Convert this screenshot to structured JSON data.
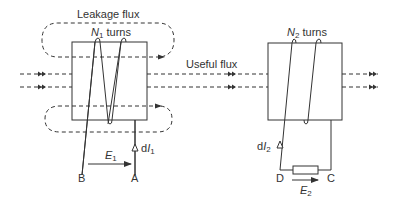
{
  "diagram": {
    "colors": {
      "line": "#333333",
      "background": "#ffffff"
    },
    "labels": {
      "leakage_flux": "Leakage flux",
      "useful_flux": "Useful flux",
      "n1_symbol": "N",
      "n1_sub": "1",
      "n1_rest": " turns",
      "n2_symbol": "N",
      "n2_sub": "2",
      "n2_rest": " turns",
      "e1_symbol": "E",
      "e1_sub": "1",
      "e2_symbol": "E",
      "e2_sub": "2",
      "di1_prefix": "d",
      "di1_symbol": "I",
      "di1_sub": "1",
      "di2_prefix": "d",
      "di2_symbol": "I",
      "di2_sub": "2",
      "terminal_a": "A",
      "terminal_b": "B",
      "terminal_c": "C",
      "terminal_d": "D"
    },
    "components": {
      "primary_core": "left core with N1-turn winding",
      "secondary_core": "right core with N2-turn winding",
      "load": "resistor between D and C"
    }
  }
}
